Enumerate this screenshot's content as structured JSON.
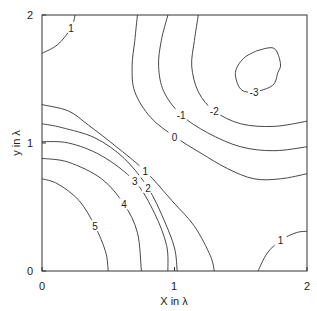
{
  "chart_data": {
    "type": "contour",
    "title": "",
    "xlabel": "X in λ",
    "ylabel": "y in λ",
    "xlim": [
      0,
      2
    ],
    "ylim": [
      0,
      2
    ],
    "grid": false,
    "legend": null,
    "x_ticks": [
      "0",
      "1",
      "2"
    ],
    "y_ticks": [
      "0",
      "1",
      "2"
    ],
    "contour_levels": [
      -3,
      -2,
      -1,
      0,
      1,
      2,
      3,
      4,
      5
    ],
    "contours": [
      {
        "level": 5,
        "label": "5",
        "points": [
          [
            0,
            0.72
          ],
          [
            0.12,
            0.68
          ],
          [
            0.28,
            0.55
          ],
          [
            0.4,
            0.35
          ],
          [
            0.48,
            0.15
          ],
          [
            0.5,
            0
          ]
        ]
      },
      {
        "level": 4,
        "label": "4",
        "points": [
          [
            0,
            0.88
          ],
          [
            0.2,
            0.85
          ],
          [
            0.45,
            0.72
          ],
          [
            0.62,
            0.52
          ],
          [
            0.72,
            0.3
          ],
          [
            0.75,
            0
          ]
        ]
      },
      {
        "level": 3,
        "label": "3",
        "points": [
          [
            0,
            1.01
          ],
          [
            0.2,
            1.0
          ],
          [
            0.45,
            0.9
          ],
          [
            0.7,
            0.7
          ],
          [
            0.85,
            0.45
          ],
          [
            0.94,
            0.2
          ],
          [
            0.95,
            0
          ]
        ]
      },
      {
        "level": 2,
        "label": "2",
        "points": [
          [
            0,
            1.15
          ],
          [
            0.15,
            1.12
          ],
          [
            0.4,
            1.04
          ],
          [
            0.62,
            0.88
          ],
          [
            0.8,
            0.65
          ],
          [
            0.92,
            0.4
          ],
          [
            1.0,
            0.18
          ],
          [
            1.02,
            0
          ]
        ]
      },
      {
        "level": 1,
        "label": "1",
        "points": [
          [
            0,
            1.3
          ],
          [
            0.2,
            1.25
          ],
          [
            0.35,
            1.14
          ],
          [
            0.55,
            0.98
          ],
          [
            0.78,
            0.78
          ],
          [
            0.98,
            0.55
          ],
          [
            1.15,
            0.35
          ],
          [
            1.27,
            0.12
          ],
          [
            1.3,
            0
          ]
        ]
      },
      {
        "level": 1,
        "label": "1",
        "points": [
          [
            0,
            1.7
          ],
          [
            0.12,
            1.77
          ],
          [
            0.22,
            1.9
          ],
          [
            0.25,
            2.0
          ]
        ]
      },
      {
        "level": 1,
        "label": "1",
        "points": [
          [
            1.63,
            0
          ],
          [
            1.7,
            0.14
          ],
          [
            1.8,
            0.24
          ],
          [
            1.92,
            0.3
          ],
          [
            2.0,
            0.31
          ]
        ]
      },
      {
        "level": 0,
        "label": "0",
        "points": [
          [
            0.72,
            2.0
          ],
          [
            0.7,
            1.8
          ],
          [
            0.68,
            1.6
          ],
          [
            0.7,
            1.4
          ],
          [
            0.82,
            1.2
          ],
          [
            1.0,
            1.05
          ],
          [
            1.2,
            0.92
          ],
          [
            1.4,
            0.8
          ],
          [
            1.6,
            0.72
          ],
          [
            1.8,
            0.72
          ],
          [
            2.0,
            0.76
          ]
        ]
      },
      {
        "level": -1,
        "label": "-1",
        "points": [
          [
            0.95,
            2.0
          ],
          [
            0.9,
            1.8
          ],
          [
            0.88,
            1.6
          ],
          [
            0.92,
            1.4
          ],
          [
            1.05,
            1.22
          ],
          [
            1.25,
            1.08
          ],
          [
            1.5,
            0.97
          ],
          [
            1.75,
            0.94
          ],
          [
            2.0,
            0.97
          ]
        ]
      },
      {
        "level": -2,
        "label": "-2",
        "points": [
          [
            1.18,
            2.0
          ],
          [
            1.15,
            1.8
          ],
          [
            1.13,
            1.6
          ],
          [
            1.18,
            1.4
          ],
          [
            1.3,
            1.25
          ],
          [
            1.5,
            1.15
          ],
          [
            1.75,
            1.13
          ],
          [
            2.0,
            1.17
          ]
        ]
      },
      {
        "level": -3,
        "label": "-3",
        "points": [
          [
            1.62,
            1.72
          ],
          [
            1.75,
            1.74
          ],
          [
            1.8,
            1.62
          ],
          [
            1.78,
            1.55
          ],
          [
            1.74,
            1.45
          ],
          [
            1.6,
            1.4
          ],
          [
            1.5,
            1.42
          ],
          [
            1.46,
            1.55
          ],
          [
            1.52,
            1.66
          ],
          [
            1.62,
            1.72
          ]
        ]
      }
    ]
  },
  "plot": {
    "x_axis_label": "X in λ",
    "y_axis_label": "y in λ",
    "x_tick_labels": [
      "0",
      "1",
      "2"
    ],
    "y_tick_labels": [
      "0",
      "1",
      "2"
    ]
  }
}
